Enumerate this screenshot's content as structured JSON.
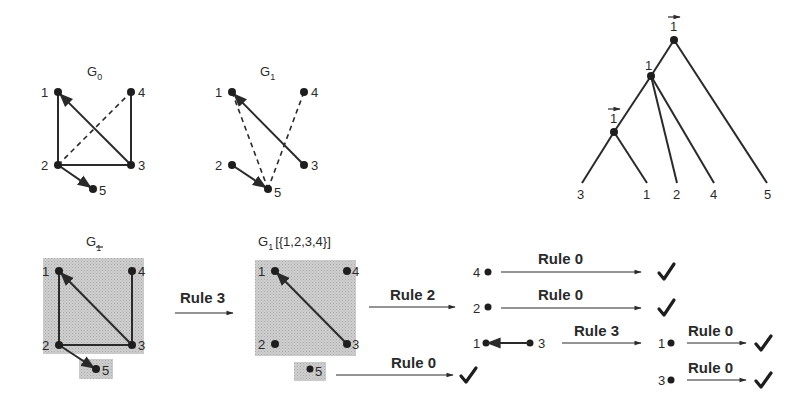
{
  "figure": {
    "graph_g0": {
      "title": "G",
      "subscript": "0",
      "nodes": [
        {
          "id": "1",
          "x": 58,
          "y": 92,
          "lx": 41,
          "ly": 97
        },
        {
          "id": "4",
          "x": 131,
          "y": 92,
          "lx": 138,
          "ly": 97
        },
        {
          "id": "2",
          "x": 58,
          "y": 165,
          "lx": 41,
          "ly": 170
        },
        {
          "id": "3",
          "x": 131,
          "y": 165,
          "lx": 138,
          "ly": 170
        },
        {
          "id": "5",
          "x": 93,
          "y": 189,
          "lx": 99,
          "ly": 195
        }
      ],
      "edges": [
        {
          "from": "1",
          "to": "2",
          "style": "solid"
        },
        {
          "from": "2",
          "to": "3",
          "style": "solid"
        },
        {
          "from": "3",
          "to": "4",
          "style": "solid"
        },
        {
          "from": "3",
          "to": "1",
          "style": "arrow"
        },
        {
          "from": "2",
          "to": "4",
          "style": "dashed"
        },
        {
          "from": "2",
          "to": "5",
          "style": "arrow"
        }
      ]
    },
    "graph_g1": {
      "title": "G",
      "subscript": "1",
      "nodes": [
        {
          "id": "1",
          "x": 232,
          "y": 92,
          "lx": 215,
          "ly": 97
        },
        {
          "id": "4",
          "x": 304,
          "y": 92,
          "lx": 311,
          "ly": 97
        },
        {
          "id": "2",
          "x": 232,
          "y": 165,
          "lx": 215,
          "ly": 170
        },
        {
          "id": "3",
          "x": 304,
          "y": 165,
          "lx": 311,
          "ly": 170
        },
        {
          "id": "5",
          "x": 268,
          "y": 189,
          "lx": 274,
          "ly": 197
        }
      ],
      "edges": [
        {
          "from": "3",
          "to": "1",
          "style": "arrow"
        },
        {
          "from": "1",
          "to": "5",
          "style": "dashed"
        },
        {
          "from": "4",
          "to": "5",
          "style": "dashed"
        },
        {
          "from": "2",
          "to": "5",
          "style": "arrow"
        }
      ]
    },
    "tree": {
      "root_label": "1",
      "root_label_arrow": true,
      "inner_label": "1",
      "inner_sub_label": "1",
      "inner_sub_label_arrow": true,
      "leaves": [
        "3",
        "1",
        "2",
        "4",
        "5"
      ]
    },
    "step_graph_g1bar": {
      "title": "G",
      "subscript": "1",
      "subscript_overline": true,
      "nodes": [
        "1",
        "4",
        "2",
        "3",
        "5"
      ]
    },
    "rule3_main": {
      "label": "Rule 3"
    },
    "step_graph_g1_partition": {
      "title": "G",
      "subscript": "1",
      "partition": "[{1,2,3,4}]",
      "nodes": [
        "1",
        "4",
        "2",
        "3",
        "5"
      ]
    },
    "rule2": {
      "label": "Rule 2"
    },
    "rule0_from5": {
      "label": "Rule 0"
    },
    "branch": [
      {
        "node": "4",
        "rule": "Rule 0"
      },
      {
        "node": "2",
        "rule": "Rule 0"
      }
    ],
    "pair": {
      "left": "1",
      "right": "3",
      "rule": "Rule 3"
    },
    "final": [
      {
        "node": "1",
        "rule": "Rule 0"
      },
      {
        "node": "3",
        "rule": "Rule 0"
      }
    ],
    "check_symbol": "✓"
  }
}
